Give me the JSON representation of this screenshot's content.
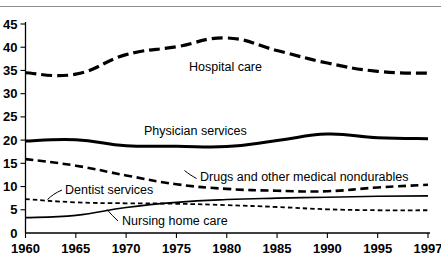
{
  "figure": {
    "background_color": "#ffffff",
    "rule_color": "#8d8d8d",
    "line_color": "#000000"
  },
  "axes": {
    "y_ticks": [
      "0",
      "5",
      "10",
      "15",
      "20",
      "25",
      "30",
      "35",
      "40",
      "45"
    ],
    "x_ticks": [
      "1960",
      "1965",
      "1970",
      "1975",
      "1980",
      "1985",
      "1990",
      "1995",
      "1997"
    ]
  },
  "labels": {
    "hospital_care": "Hospital care",
    "physician_services": "Physician services",
    "drugs": "Drugs and other medical nondurables",
    "dentist_services": "Dentist services",
    "nursing_home_care": "Nursing home care"
  },
  "chart_data": {
    "type": "line",
    "title": "",
    "subtitle": "",
    "xlabel": "",
    "ylabel": "",
    "xlim": [
      1960,
      1997
    ],
    "ylim": [
      0,
      45
    ],
    "ytick_step": 5,
    "grid": false,
    "legend": "inline-annotations",
    "x": [
      1960,
      1965,
      1970,
      1975,
      1980,
      1985,
      1990,
      1995,
      1997
    ],
    "series": [
      {
        "name": "Hospital care",
        "style": "long-dash",
        "stroke_width": 3.2,
        "dasharray": "11,5",
        "values": [
          34.5,
          34.2,
          38.4,
          40.1,
          42.0,
          39.3,
          36.6,
          34.8,
          34.4
        ]
      },
      {
        "name": "Physician services",
        "style": "solid",
        "stroke_width": 3.0,
        "dasharray": "none",
        "values": [
          19.8,
          20.1,
          18.8,
          18.7,
          18.6,
          19.9,
          21.3,
          20.5,
          20.3
        ]
      },
      {
        "name": "Drugs and other medical nondurables",
        "style": "dash",
        "stroke_width": 2.6,
        "dasharray": "8,4.5",
        "values": [
          15.9,
          14.5,
          12.4,
          10.5,
          9.5,
          9.1,
          9.0,
          9.8,
          10.4
        ]
      },
      {
        "name": "Dentist services",
        "style": "fine-dash",
        "stroke_width": 1.8,
        "dasharray": "4.5,3",
        "values": [
          7.3,
          6.6,
          6.4,
          6.3,
          6.0,
          5.6,
          5.1,
          4.9,
          4.9
        ]
      },
      {
        "name": "Nursing home care",
        "style": "thin-solid",
        "stroke_width": 1.6,
        "dasharray": "none",
        "values": [
          3.3,
          3.8,
          5.5,
          6.6,
          7.2,
          7.5,
          7.7,
          7.9,
          8.0
        ]
      }
    ]
  }
}
